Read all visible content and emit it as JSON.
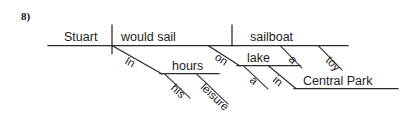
{
  "page": {
    "question_number": "8)",
    "width": 416,
    "height": 121,
    "background_color": "#ffffff",
    "ink_color": "#2b2b2b"
  },
  "diagram": {
    "type": "reed-kellogg sentence diagram",
    "sentence": "Stuart would sail his toy sailboat in his leisure hours on a lake in Central Park",
    "baseline": {
      "subject": "Stuart",
      "verb": "would sail",
      "direct_object": "sailboat"
    },
    "modifiers": [
      {
        "word": "In",
        "attaches_to": "would sail",
        "kind": "preposition-slant"
      },
      {
        "word": "hours",
        "attaches_to": "In",
        "kind": "object-of-preposition"
      },
      {
        "word": "his",
        "attaches_to": "hours",
        "kind": "modifier-slant"
      },
      {
        "word": "leisure",
        "attaches_to": "hours",
        "kind": "modifier-slant"
      },
      {
        "word": "on",
        "attaches_to": "would sail",
        "kind": "preposition-slant"
      },
      {
        "word": "lake",
        "attaches_to": "on",
        "kind": "object-of-preposition"
      },
      {
        "word": "a",
        "attaches_to": "lake",
        "kind": "modifier-slant"
      },
      {
        "word": "in",
        "attaches_to": "lake",
        "kind": "preposition-slant"
      },
      {
        "word": "Central Park",
        "attaches_to": "in",
        "kind": "object-of-preposition"
      },
      {
        "word": "a",
        "attaches_to": "sailboat",
        "kind": "modifier-slant"
      },
      {
        "word": "toy",
        "attaches_to": "sailboat",
        "kind": "modifier-slant"
      }
    ],
    "labels": {
      "subject": "Stuart",
      "verb": "would sail",
      "object": "sailboat",
      "prep_in_upper": "In",
      "obj_hours": "hours",
      "mod_his": "his",
      "mod_leisure": "leisure",
      "prep_on": "on",
      "obj_lake": "lake",
      "mod_a_lake": "a",
      "prep_in_lower": "in",
      "obj_central_park": "Central Park",
      "mod_a_sailboat": "a",
      "mod_toy": "toy"
    }
  }
}
